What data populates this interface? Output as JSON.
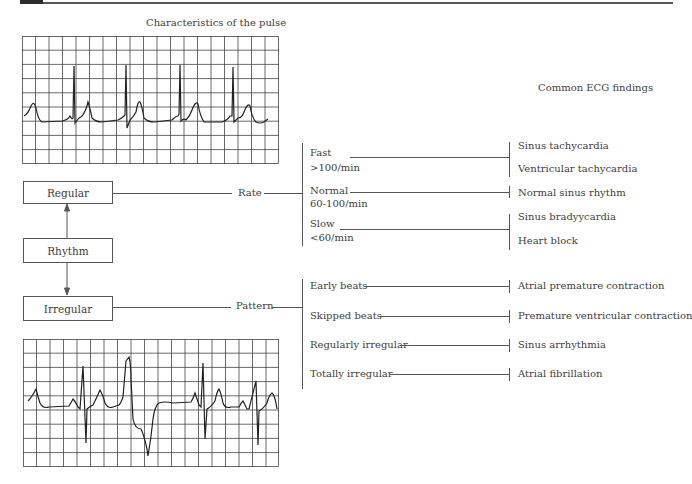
{
  "header": {
    "bar_color": "#2b2b2b",
    "line_color": "#555555"
  },
  "titles": {
    "pulse": "Characteristics of the pulse",
    "findings": "Common ECG findings"
  },
  "flow": {
    "regular": "Regular",
    "rhythm": "Rhythm",
    "irregular": "Irregular",
    "rate": "Rate",
    "pattern": "Pattern"
  },
  "rate_branches": [
    {
      "label": "Fast",
      "sub": ">100/min",
      "findings": [
        "Sinus tachycardia",
        "Ventricular tachycardia"
      ]
    },
    {
      "label": "Normal",
      "sub": "60-100/min",
      "findings": [
        "Normal sinus rhythm"
      ]
    },
    {
      "label": "Slow",
      "sub": "<60/min",
      "findings": [
        "Sinus bradyycardia",
        "Heart block"
      ]
    }
  ],
  "pattern_branches": [
    {
      "label": "Early beats",
      "finding": "Atrial premature contraction"
    },
    {
      "label": "Skipped beats",
      "finding": "Premature ventricular contraction"
    },
    {
      "label": "Regularly irregular",
      "finding": "Sinus arrhythmia"
    },
    {
      "label": "Totally irregular",
      "finding": "Atrial fibrillation"
    }
  ],
  "ecg_strips": [
    {
      "name": "regular-rhythm-strip",
      "grid_cols": 19,
      "grid_rows": 9
    },
    {
      "name": "irregular-rhythm-strip",
      "grid_cols": 19,
      "grid_rows": 9
    }
  ]
}
